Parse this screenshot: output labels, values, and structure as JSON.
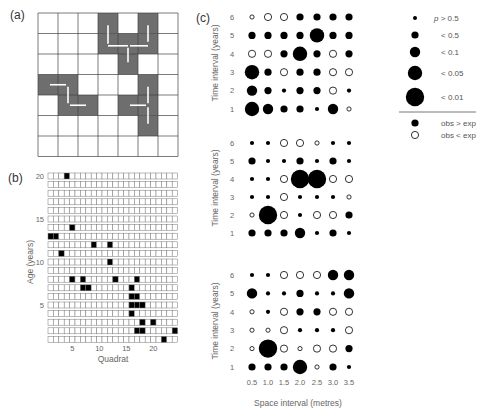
{
  "chart_data": [
    {
      "panel": "(a)",
      "type": "heatmap",
      "title": "",
      "grid_size": [
        7,
        7
      ],
      "shaded_cells": [
        [
          0,
          3
        ],
        [
          0,
          5
        ],
        [
          1,
          3
        ],
        [
          1,
          4
        ],
        [
          1,
          5
        ],
        [
          2,
          4
        ],
        [
          3,
          0
        ],
        [
          3,
          1
        ],
        [
          3,
          5
        ],
        [
          4,
          1
        ],
        [
          4,
          2
        ],
        [
          4,
          4
        ],
        [
          4,
          5
        ],
        [
          5,
          5
        ]
      ],
      "shaded_cells_format": "[row, col] from top-left",
      "shade_color": "#707070",
      "arrows": [
        {
          "from": [
            1.5,
            3.5
          ],
          "to": [
            0.6,
            3.5
          ]
        },
        {
          "from": [
            1.6,
            3.5
          ],
          "to": [
            1.6,
            4.5
          ]
        },
        {
          "from": [
            1.6,
            5.5
          ],
          "to": [
            1.6,
            4.6
          ]
        },
        {
          "from": [
            1.4,
            5.5
          ],
          "to": [
            0.6,
            5.5
          ]
        },
        {
          "from": [
            1.7,
            4.5
          ],
          "to": [
            2.4,
            4.5
          ]
        },
        {
          "from": [
            3.5,
            0.6
          ],
          "to": [
            3.5,
            1.4
          ]
        },
        {
          "from": [
            3.6,
            1.5
          ],
          "to": [
            4.4,
            1.5
          ]
        },
        {
          "from": [
            4.5,
            1.6
          ],
          "to": [
            4.5,
            2.4
          ]
        },
        {
          "from": [
            4.5,
            4.6
          ],
          "to": [
            4.5,
            5.4
          ]
        },
        {
          "from": [
            4.4,
            5.5
          ],
          "to": [
            3.6,
            5.5
          ]
        },
        {
          "from": [
            4.6,
            5.5
          ],
          "to": [
            5.4,
            5.5
          ]
        }
      ]
    },
    {
      "panel": "(b)",
      "type": "heatmap",
      "xlabel": "Quadrat",
      "ylabel": "Age (years)",
      "x_range": [
        1,
        24
      ],
      "y_range": [
        1,
        20
      ],
      "x_ticks": [
        5,
        10,
        15,
        20
      ],
      "y_ticks": [
        5,
        10,
        15,
        20
      ],
      "filled": [
        {
          "age": 20,
          "quadrats": [
            4
          ]
        },
        {
          "age": 14,
          "quadrats": [
            5
          ]
        },
        {
          "age": 13,
          "quadrats": [
            1,
            2
          ]
        },
        {
          "age": 12,
          "quadrats": [
            9,
            12
          ]
        },
        {
          "age": 11,
          "quadrats": [
            3
          ]
        },
        {
          "age": 10,
          "quadrats": [
            12
          ]
        },
        {
          "age": 8,
          "quadrats": [
            5,
            7,
            13,
            17
          ]
        },
        {
          "age": 7,
          "quadrats": [
            7,
            8,
            16
          ]
        },
        {
          "age": 6,
          "quadrats": [
            16,
            17
          ]
        },
        {
          "age": 5,
          "quadrats": [
            16,
            17,
            18
          ]
        },
        {
          "age": 4,
          "quadrats": [
            16
          ]
        },
        {
          "age": 3,
          "quadrats": [
            18,
            20
          ]
        },
        {
          "age": 2,
          "quadrats": [
            17,
            18,
            24
          ]
        },
        {
          "age": 1,
          "quadrats": [
            22
          ]
        }
      ]
    },
    {
      "panel": "(c)",
      "type": "scatter",
      "subtype": "bubble-matrix",
      "xlabel": "Space interval (metres)",
      "ylabel": "Time interval (years)",
      "x": [
        0.5,
        1.0,
        1.5,
        2.0,
        2.5,
        3.0,
        3.5
      ],
      "y": [
        6,
        5,
        4,
        3,
        2,
        1
      ],
      "size_levels": [
        "p > 0.5",
        "< 0.5",
        "< 0.1",
        "< 0.05",
        "< 0.01"
      ],
      "cell_format": "[significance_level_index, obs_gt_exp (1=filled,0=open)]",
      "subplots": [
        {
          "name": "top",
          "rows": [
            [
              [
                0,
                0
              ],
              [
                1,
                0
              ],
              [
                1,
                0
              ],
              [
                1,
                1
              ],
              [
                1,
                1
              ],
              [
                1,
                1
              ],
              [
                1,
                1
              ]
            ],
            [
              [
                1,
                1
              ],
              [
                1,
                1
              ],
              [
                1,
                1
              ],
              [
                1,
                1
              ],
              [
                3,
                1
              ],
              [
                1,
                1
              ],
              [
                1,
                1
              ]
            ],
            [
              [
                1,
                0
              ],
              [
                1,
                0
              ],
              [
                1,
                1
              ],
              [
                3,
                1
              ],
              [
                1,
                1
              ],
              [
                1,
                0
              ],
              [
                1,
                1
              ]
            ],
            [
              [
                3,
                1
              ],
              [
                1,
                1
              ],
              [
                1,
                0
              ],
              [
                1,
                1
              ],
              [
                1,
                1
              ],
              [
                1,
                0
              ],
              [
                1,
                0
              ]
            ],
            [
              [
                2,
                1
              ],
              [
                1,
                1
              ],
              [
                0,
                1
              ],
              [
                1,
                1
              ],
              [
                1,
                1
              ],
              [
                1,
                0
              ],
              [
                0,
                1
              ]
            ],
            [
              [
                3,
                1
              ],
              [
                2,
                1
              ],
              [
                1,
                1
              ],
              [
                1,
                1
              ],
              [
                0,
                1
              ],
              [
                2,
                1
              ],
              [
                0,
                0
              ]
            ]
          ]
        },
        {
          "name": "middle",
          "rows": [
            [
              [
                0,
                1
              ],
              [
                0,
                1
              ],
              [
                1,
                0
              ],
              [
                1,
                0
              ],
              [
                0,
                0
              ],
              [
                0,
                1
              ],
              [
                0,
                1
              ]
            ],
            [
              [
                1,
                1
              ],
              [
                0,
                1
              ],
              [
                0,
                1
              ],
              [
                1,
                1
              ],
              [
                0,
                1
              ],
              [
                1,
                1
              ],
              [
                0,
                1
              ]
            ],
            [
              [
                0,
                1
              ],
              [
                0,
                1
              ],
              [
                1,
                0
              ],
              [
                4,
                1
              ],
              [
                4,
                1
              ],
              [
                1,
                0
              ],
              [
                1,
                0
              ]
            ],
            [
              [
                0,
                1
              ],
              [
                0,
                1
              ],
              [
                1,
                0
              ],
              [
                0,
                1
              ],
              [
                0,
                1
              ],
              [
                0,
                1
              ],
              [
                0,
                0
              ]
            ],
            [
              [
                0,
                0
              ],
              [
                4,
                1
              ],
              [
                1,
                0
              ],
              [
                0,
                1
              ],
              [
                1,
                0
              ],
              [
                1,
                0
              ],
              [
                1,
                1
              ]
            ],
            [
              [
                1,
                1
              ],
              [
                1,
                1
              ],
              [
                1,
                1
              ],
              [
                2,
                1
              ],
              [
                0,
                1
              ],
              [
                1,
                1
              ],
              [
                0,
                1
              ]
            ]
          ]
        },
        {
          "name": "bottom",
          "rows": [
            [
              [
                0,
                1
              ],
              [
                0,
                1
              ],
              [
                1,
                0
              ],
              [
                1,
                0
              ],
              [
                1,
                0
              ],
              [
                2,
                1
              ],
              [
                2,
                1
              ]
            ],
            [
              [
                2,
                1
              ],
              [
                0,
                1
              ],
              [
                0,
                1
              ],
              [
                1,
                1
              ],
              [
                0,
                1
              ],
              [
                0,
                1
              ],
              [
                2,
                1
              ]
            ],
            [
              [
                0,
                0
              ],
              [
                0,
                1
              ],
              [
                1,
                0
              ],
              [
                1,
                1
              ],
              [
                1,
                1
              ],
              [
                1,
                0
              ],
              [
                1,
                0
              ]
            ],
            [
              [
                0,
                0
              ],
              [
                0,
                0
              ],
              [
                1,
                0
              ],
              [
                0,
                1
              ],
              [
                0,
                1
              ],
              [
                0,
                1
              ],
              [
                1,
                0
              ]
            ],
            [
              [
                0,
                0
              ],
              [
                4,
                1
              ],
              [
                1,
                0
              ],
              [
                0,
                0
              ],
              [
                1,
                0
              ],
              [
                1,
                0
              ],
              [
                1,
                1
              ]
            ],
            [
              [
                1,
                1
              ],
              [
                1,
                1
              ],
              [
                1,
                1
              ],
              [
                3,
                1
              ],
              [
                0,
                0
              ],
              [
                1,
                1
              ],
              [
                0,
                1
              ]
            ]
          ]
        }
      ],
      "legend": {
        "size_items": [
          "p > 0.5",
          "< 0.5",
          "< 0.1",
          "< 0.05",
          "< 0.01"
        ],
        "fill_items": [
          "obs > exp",
          "obs < exp"
        ],
        "position": "right"
      }
    }
  ],
  "labels": {
    "panel_a": "(a)",
    "panel_b": "(b)",
    "panel_c": "(c)",
    "b_ylabel": "Age (years)",
    "b_xlabel": "Quadrat",
    "c_ylabel": "Time interval (years)",
    "c_xlabel": "Space interval (metres)",
    "legend_p": "p",
    "legend_p_rest": " > 0.5",
    "legend_05": "< 0.5",
    "legend_01": "< 0.1",
    "legend_005": "< 0.05",
    "legend_001": "< 0.01",
    "legend_obs_gt": "obs > exp",
    "legend_obs_lt": "obs < exp"
  },
  "colors": {
    "grid_line": "#444444",
    "shade": "#6e6e6e",
    "dot": "#000000",
    "arrow": "#ffffff"
  }
}
